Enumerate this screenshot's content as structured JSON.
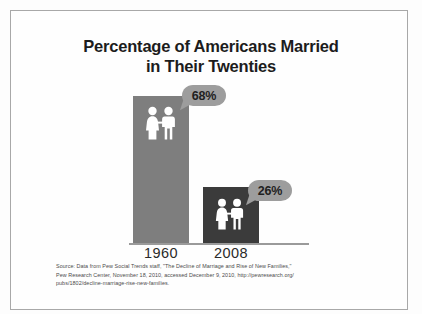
{
  "figure": {
    "title_line1": "Percentage of Americans Married",
    "title_line2": "in Their Twenties",
    "frame_color": "#a8a8a8",
    "background": "#fefefe"
  },
  "chart_data": {
    "type": "bar",
    "title": "Percentage of Americans Married in Their Twenties",
    "subtitle": "",
    "xlabel": "",
    "ylabel": "",
    "categories": [
      "1960",
      "2008"
    ],
    "values": [
      68,
      26
    ],
    "value_labels": [
      "68%",
      "26%"
    ],
    "unit": "percent",
    "ylim": [
      0,
      68
    ],
    "grid": false,
    "legend": "none",
    "series": [
      {
        "name": "Percentage married in their twenties",
        "values": [
          68,
          26
        ]
      }
    ],
    "bar_colors": [
      "#7e7e7e",
      "#3b3b3b"
    ],
    "callout_color": "#9d9d9d",
    "annotations": [
      {
        "category": "1960",
        "text": "68%"
      },
      {
        "category": "2008",
        "text": "26%"
      }
    ],
    "icons": [
      "couple-pictogram",
      "couple-pictogram"
    ]
  },
  "axis": {
    "tick_labels": [
      "1960",
      "2008"
    ],
    "baseline_color": "#9a9a9a"
  },
  "source": {
    "line1": "Source: Data from Pew Social Trends staff, \"The Decline of Marriage and Rise of New Families,\"",
    "line2": "Pew Research Center, November 18, 2010, accessed December 9, 2010, http://pewresearch.org/",
    "line3": "pubs/1802/decline-marriage-rise-new-families."
  }
}
